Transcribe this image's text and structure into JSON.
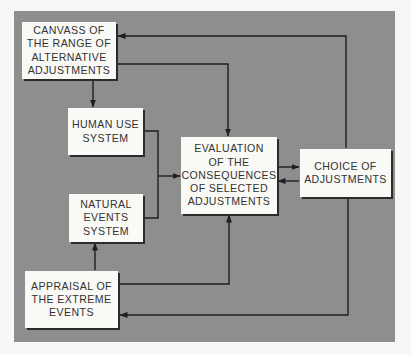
{
  "diagram": {
    "type": "flowchart",
    "background_color": "#8e8e8e",
    "box_color": "#f9f9f6",
    "line_color": "#1e1e1e",
    "nodes": {
      "canvass": {
        "label": "CANVASS OF\nTHE RANGE OF\nALTERNATIVE\nADJUSTMENTS"
      },
      "human_use": {
        "label": "HUMAN USE\nSYSTEM"
      },
      "natural_events": {
        "label": "NATURAL\nEVENTS\nSYSTEM"
      },
      "evaluation": {
        "label": "EVALUATION\nOF THE\nCONSEQUENCES\nOF SELECTED\nADJUSTMENTS"
      },
      "choice": {
        "label": "CHOICE OF\nADJUSTMENTS"
      },
      "appraisal": {
        "label": "APPRAISAL OF\nTHE EXTREME\nEVENTS"
      }
    },
    "edges": [
      {
        "from": "canvass",
        "to": "human_use"
      },
      {
        "from": "canvass",
        "to": "evaluation"
      },
      {
        "from": "human_use",
        "to": "evaluation"
      },
      {
        "from": "natural_events",
        "to": "evaluation"
      },
      {
        "from": "appraisal",
        "to": "natural_events"
      },
      {
        "from": "appraisal",
        "to": "evaluation"
      },
      {
        "from": "evaluation",
        "to": "choice"
      },
      {
        "from": "choice",
        "to": "evaluation"
      },
      {
        "from": "choice",
        "to": "canvass"
      },
      {
        "from": "choice",
        "to": "appraisal"
      }
    ]
  }
}
